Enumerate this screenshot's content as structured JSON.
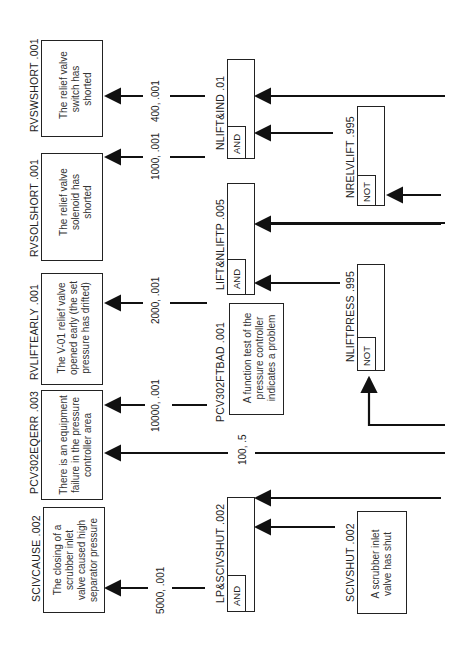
{
  "diagram": {
    "orientation": "rotated-90-ccw",
    "top_events": [
      {
        "id": "RVSWSHORT",
        "label": "RVSWSHORT .001",
        "text": [
          "The relief valve",
          "switch has",
          "shorted"
        ]
      },
      {
        "id": "RVSOLSHORT",
        "label": "RVSOLSHORT .001",
        "text": [
          "The relief valve",
          "solenoid has",
          "shorted"
        ]
      },
      {
        "id": "RVLIFTEARLY",
        "label": "RVLIFTEARLY .001",
        "text": [
          "The V-01 relief valve",
          "opened early (the set",
          "pressure has drifted)"
        ]
      },
      {
        "id": "PCV302EQERR",
        "label": "PCV302EQERR .003",
        "text": [
          "There is an equipment",
          "failure in the pressure",
          "controller area"
        ]
      },
      {
        "id": "SCIVCAUSE",
        "label": "SCIVCAUSE .002",
        "text": [
          "The closing of a",
          "scrubber inlet",
          "valve caused high",
          "separator pressure"
        ]
      }
    ],
    "link_values": [
      {
        "id": "v400",
        "text": "400, .001"
      },
      {
        "id": "v1000",
        "text": "1000, .001"
      },
      {
        "id": "v2000",
        "text": "2000, .001"
      },
      {
        "id": "v10000",
        "text": "10000, .001"
      },
      {
        "id": "v100",
        "text": "100, .5"
      },
      {
        "id": "v5000",
        "text": "5000, .001"
      }
    ],
    "gates": [
      {
        "id": "NLIFTIND",
        "label": "NLIFT&IND .01",
        "type": "AND"
      },
      {
        "id": "LIFTNLIFTP",
        "label": "LIFT&NLIFTP .005",
        "type": "AND"
      },
      {
        "id": "LPSCIVSHUT",
        "label": "LP&SCIVSHUT .002",
        "type": "AND"
      },
      {
        "id": "NRELVLIFT",
        "label": "NRELVLIFT .995",
        "type": "NOT"
      },
      {
        "id": "NLIFTPRESS",
        "label": "NLIFTPRESS .995",
        "type": "NOT"
      }
    ],
    "basic_events": [
      {
        "id": "PCV302FTBAD",
        "label": "PCV302FTBAD .001",
        "text": [
          "A function test of the",
          "pressure controller",
          "indicates a problem"
        ]
      },
      {
        "id": "SCIVSHUT",
        "label": "SCIVSHUT .002",
        "text": [
          "A scrubber inlet",
          "valve has shut"
        ]
      }
    ],
    "colors": {
      "line": "#111111",
      "box_border": "#222222",
      "text": "#333333",
      "background": "#ffffff"
    }
  }
}
